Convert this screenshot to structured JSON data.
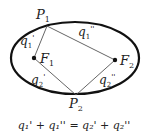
{
  "diagram": {
    "points": {
      "P1": {
        "label": "P",
        "sub": "1",
        "x": 47,
        "y": 26
      },
      "P2": {
        "label": "P",
        "sub": "2",
        "x": 76,
        "y": 95
      },
      "F1": {
        "label": "F",
        "sub": "1",
        "x": 34,
        "y": 58
      },
      "F2": {
        "label": "F",
        "sub": "2",
        "x": 115,
        "y": 60
      }
    },
    "segments": {
      "q1_prime": {
        "label": "q",
        "sub": "1",
        "prime": "'"
      },
      "q1_dprime": {
        "label": "q",
        "sub": "1",
        "prime": "''"
      },
      "q2_prime": {
        "label": "q",
        "sub": "2",
        "prime": "'"
      },
      "q2_dprime": {
        "label": "q",
        "sub": "2",
        "prime": "''"
      }
    },
    "equation": "q₁' + q₁'' = q₂' + q₂''",
    "colors": {
      "ellipse": "#111111",
      "lines": "#555555",
      "text": "#222222"
    }
  }
}
